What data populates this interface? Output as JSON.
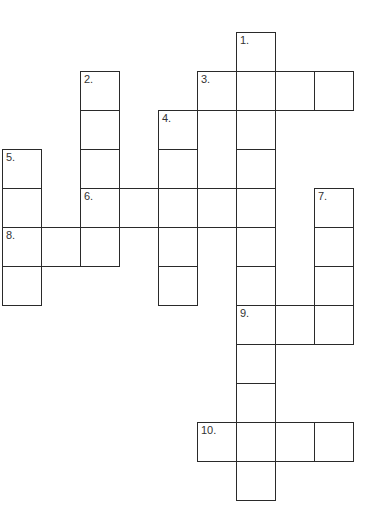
{
  "puzzle": {
    "type": "crossword",
    "grid_origin": {
      "x": 2,
      "y": 32
    },
    "cell_size": 39,
    "entries": [
      {
        "number": "1.",
        "direction": "down",
        "row": 0,
        "col": 6,
        "length": 12
      },
      {
        "number": "2.",
        "direction": "down",
        "row": 1,
        "col": 2,
        "length": 4
      },
      {
        "number": "3.",
        "direction": "across",
        "row": 1,
        "col": 5,
        "length": 4
      },
      {
        "number": "4.",
        "direction": "down",
        "row": 2,
        "col": 4,
        "length": 5
      },
      {
        "number": "5.",
        "direction": "down",
        "row": 3,
        "col": 0,
        "length": 4
      },
      {
        "number": "6.",
        "direction": "across",
        "row": 4,
        "col": 2,
        "length": 5
      },
      {
        "number": "7.",
        "direction": "down",
        "row": 4,
        "col": 8,
        "length": 4
      },
      {
        "number": "8.",
        "direction": "across",
        "row": 5,
        "col": 0,
        "length": 3
      },
      {
        "number": "9.",
        "direction": "across",
        "row": 7,
        "col": 6,
        "length": 3
      },
      {
        "number": "10.",
        "direction": "across",
        "row": 10,
        "col": 5,
        "length": 4
      }
    ]
  }
}
